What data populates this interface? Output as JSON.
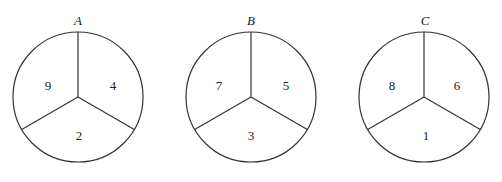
{
  "diagram": {
    "type": "spinners",
    "stroke_color": "#333333",
    "spinners": [
      {
        "label": "A",
        "cx": 78,
        "cy": 97,
        "r": 65,
        "sectors": {
          "upper_left": "9",
          "upper_right": "4",
          "bottom": "2"
        }
      },
      {
        "label": "B",
        "cx": 251,
        "cy": 97,
        "r": 65,
        "sectors": {
          "upper_left": "7",
          "upper_right": "5",
          "bottom": "3"
        }
      },
      {
        "label": "C",
        "cx": 424,
        "cy": 97,
        "r": 65,
        "sectors": {
          "upper_left": "8",
          "upper_right": "6",
          "bottom": "1"
        }
      }
    ]
  }
}
